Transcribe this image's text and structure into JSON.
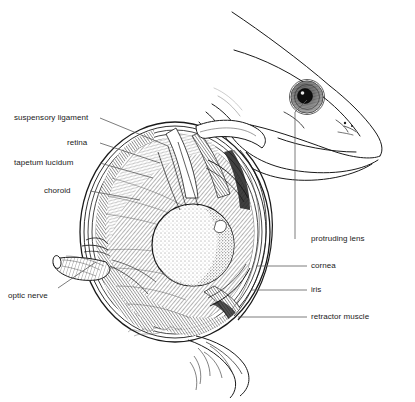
{
  "figure": {
    "background_color": "#ffffff",
    "ink_color": "#1a1a1a",
    "leader_color": "#555555",
    "signature": ""
  },
  "labels_left": [
    {
      "text": "suspensory ligament",
      "x": 14,
      "y": 113,
      "anchor_x": 100,
      "anchor_y": 118,
      "tip_x": 168,
      "tip_y": 146
    },
    {
      "text": "retina",
      "x": 67,
      "y": 138,
      "anchor_x": 100,
      "anchor_y": 143,
      "tip_x": 160,
      "tip_y": 163
    },
    {
      "text": "tapetum lucidum",
      "x": 14,
      "y": 158,
      "anchor_x": 100,
      "anchor_y": 163,
      "tip_x": 153,
      "tip_y": 178
    },
    {
      "text": "choroid",
      "x": 44,
      "y": 186,
      "anchor_x": 90,
      "anchor_y": 191,
      "tip_x": 140,
      "tip_y": 200
    },
    {
      "text": "optic nerve",
      "x": 8,
      "y": 291,
      "anchor_x": 58,
      "anchor_y": 288,
      "tip_x": 96,
      "tip_y": 262
    }
  ],
  "labels_right": [
    {
      "text": "protruding lens",
      "x": 311,
      "y": 234,
      "anchor_x": 307,
      "anchor_y": 239,
      "elbow_x": 307,
      "elbow_y": 112,
      "tip_x": 307,
      "tip_y": 100
    },
    {
      "text": "cornea",
      "x": 311,
      "y": 261,
      "anchor_x": 307,
      "anchor_y": 266,
      "tip_x": 256,
      "tip_y": 266
    },
    {
      "text": "iris",
      "x": 311,
      "y": 285,
      "anchor_x": 307,
      "anchor_y": 290,
      "tip_x": 252,
      "tip_y": 290
    },
    {
      "text": "retractor muscle",
      "x": 311,
      "y": 312,
      "anchor_x": 307,
      "anchor_y": 317,
      "tip_x": 238,
      "tip_y": 317
    }
  ],
  "structures": {
    "fish_head": "fish head with protruding eye, open jaw and gill cover",
    "fish_eye": {
      "cx": 307,
      "cy": 97,
      "r": 16
    },
    "eye_section": {
      "cx": 175,
      "cy": 232,
      "rx": 95,
      "ry": 110
    },
    "lens": {
      "cx": 193,
      "cy": 245,
      "r": 41
    },
    "optic_nerve": "cylindrical nerve exiting lower-left of the eyeball"
  }
}
